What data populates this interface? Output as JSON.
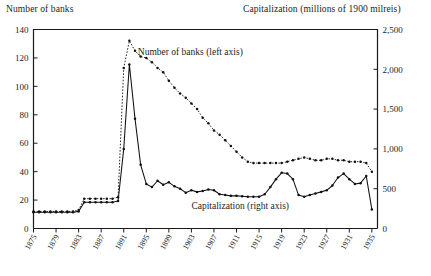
{
  "chart_data": {
    "type": "line",
    "title": "",
    "left_axis_title": "Number of banks",
    "right_axis_title": "Capitalization (millions of 1900 milreis)",
    "xlabel": "",
    "xlim": [
      1875,
      1936
    ],
    "grid": false,
    "legend_position": "inline-annotation",
    "left_axis": {
      "label": "Number of banks",
      "ylim": [
        0,
        140
      ],
      "ticks": [
        0,
        20,
        40,
        60,
        80,
        100,
        120,
        140
      ],
      "tick_labels": [
        "0",
        "20",
        "40",
        "60",
        "80",
        "100",
        "120",
        "140"
      ]
    },
    "right_axis": {
      "label": "Capitalization (millions of 1900 milreis)",
      "ylim": [
        0,
        2500
      ],
      "ticks": [
        0,
        500,
        1000,
        1500,
        2000,
        2500
      ],
      "tick_labels": [
        "0",
        "500",
        "1,000",
        "1,500",
        "2,000",
        "2,500"
      ]
    },
    "x_tick_labels": [
      "1875",
      "1879",
      "1883",
      "1887",
      "1891",
      "1895",
      "1899",
      "1903",
      "1907",
      "1911",
      "1915",
      "1919",
      "1923",
      "1927",
      "1931",
      "1935"
    ],
    "x_tick_values": [
      1875,
      1879,
      1883,
      1887,
      1891,
      1895,
      1899,
      1903,
      1907,
      1911,
      1915,
      1919,
      1923,
      1927,
      1931,
      1935
    ],
    "annotations": [
      {
        "text": "Number of banks (left axis)",
        "x": 1893.5,
        "y": 122,
        "axis": "left"
      },
      {
        "text": "Capitalization (right axis)",
        "x": 1903,
        "y": 250,
        "axis": "right"
      }
    ],
    "x": [
      1875,
      1876,
      1877,
      1878,
      1879,
      1880,
      1881,
      1882,
      1883,
      1884,
      1885,
      1886,
      1887,
      1888,
      1889,
      1890,
      1891,
      1892,
      1893,
      1894,
      1895,
      1896,
      1897,
      1898,
      1899,
      1900,
      1901,
      1902,
      1903,
      1904,
      1905,
      1906,
      1907,
      1908,
      1909,
      1910,
      1911,
      1912,
      1913,
      1914,
      1915,
      1916,
      1917,
      1918,
      1919,
      1920,
      1921,
      1922,
      1923,
      1924,
      1925,
      1926,
      1927,
      1928,
      1929,
      1930,
      1931,
      1932,
      1933,
      1934,
      1935
    ],
    "series": [
      {
        "name": "Number of banks (left axis)",
        "axis": "left",
        "style": "dotted-with-markers",
        "units": "banks",
        "values": [
          12,
          12,
          12,
          12,
          12,
          12,
          12,
          12,
          13,
          21,
          21,
          21,
          21,
          21,
          21,
          22,
          113,
          132,
          125,
          121,
          120,
          117,
          113,
          110,
          104,
          99,
          95,
          92,
          88,
          84,
          78,
          74,
          69,
          66,
          62,
          58,
          54,
          50,
          47,
          46,
          46,
          46,
          46,
          46,
          46,
          47,
          48,
          49,
          50,
          49,
          48,
          48,
          49,
          49,
          48,
          48,
          47,
          47,
          47,
          46,
          40
        ]
      },
      {
        "name": "Capitalization (right axis)",
        "axis": "right",
        "style": "solid-with-markers",
        "units": "millions of 1900 milreis",
        "values": [
          205,
          205,
          205,
          205,
          205,
          205,
          205,
          205,
          215,
          330,
          330,
          330,
          330,
          330,
          330,
          345,
          1000,
          2060,
          1380,
          800,
          560,
          520,
          600,
          550,
          580,
          530,
          500,
          450,
          480,
          460,
          470,
          490,
          480,
          430,
          420,
          410,
          410,
          405,
          400,
          400,
          400,
          430,
          520,
          620,
          700,
          690,
          620,
          420,
          400,
          420,
          440,
          460,
          480,
          540,
          640,
          690,
          620,
          560,
          570,
          660,
          240
        ]
      }
    ]
  }
}
